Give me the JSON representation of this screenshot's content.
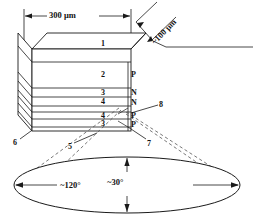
{
  "figure": {
    "type": "technical-diagram"
  },
  "dimensions": {
    "width_label": "300 μm",
    "depth_label": "~100 μm"
  },
  "layer_callouts": {
    "top_face": "1",
    "layer_2": "2",
    "layer_3": "3",
    "layer_4": "4",
    "layer_4b": "4",
    "layer_3b": "3"
  },
  "doping_labels": [
    "P",
    "N",
    "N",
    "P",
    "P"
  ],
  "side_callouts": {
    "right_upper": "8",
    "bottom_left": "6",
    "bottom_center": "5",
    "bottom_right": "7"
  },
  "beam_pattern": {
    "horizontal_angle": "~120°",
    "vertical_angle": "~30°"
  },
  "colors": {
    "line": "#1a1a1a",
    "fill": "#ffffff",
    "dashed": "#555555"
  }
}
